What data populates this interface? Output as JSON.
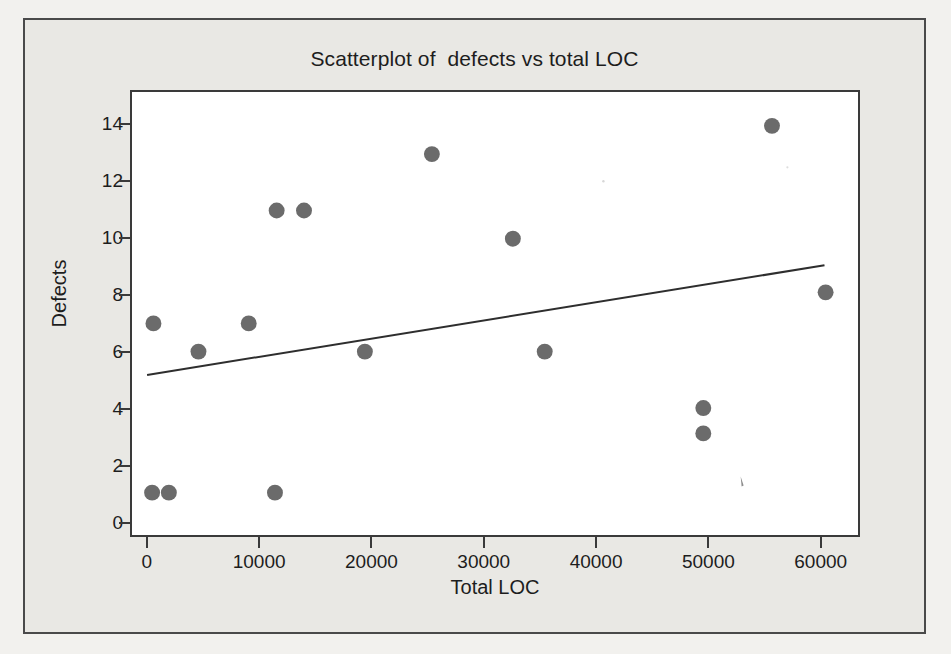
{
  "figure": {
    "title": "Scatterplot of  defects vs total LOC",
    "background_color": "#e9e8e4",
    "panel_color": "#ffffff",
    "frame_color": "#4a4a4a",
    "marker_color": "#6b6b6b",
    "line_color": "#2e2e2e"
  },
  "axes": {
    "x_title": "Total LOC",
    "y_title": "Defects",
    "x_ticks": [
      "0",
      "10000",
      "20000",
      "30000",
      "40000",
      "50000",
      "60000"
    ],
    "y_ticks": [
      "0",
      "2",
      "4",
      "6",
      "8",
      "10",
      "12",
      "14"
    ]
  },
  "chart_data": {
    "type": "scatter",
    "title": "Scatterplot of  defects vs total LOC",
    "xlabel": "Total LOC",
    "ylabel": "Defects",
    "xlim": [
      -1500,
      63500
    ],
    "ylim": [
      -0.5,
      15.2
    ],
    "xticks": [
      0,
      10000,
      20000,
      30000,
      40000,
      50000,
      60000
    ],
    "yticks": [
      0,
      2,
      4,
      6,
      8,
      10,
      12,
      14
    ],
    "grid": false,
    "legend": null,
    "points": [
      {
        "x": 300,
        "y": 1
      },
      {
        "x": 420,
        "y": 7
      },
      {
        "x": 1800,
        "y": 1
      },
      {
        "x": 4450,
        "y": 6
      },
      {
        "x": 8950,
        "y": 7
      },
      {
        "x": 11300,
        "y": 1
      },
      {
        "x": 11450,
        "y": 11
      },
      {
        "x": 13900,
        "y": 11
      },
      {
        "x": 19350,
        "y": 6
      },
      {
        "x": 25350,
        "y": 13
      },
      {
        "x": 32600,
        "y": 10
      },
      {
        "x": 35450,
        "y": 6
      },
      {
        "x": 49650,
        "y": 4
      },
      {
        "x": 49650,
        "y": 3.1
      },
      {
        "x": 55800,
        "y": 14
      },
      {
        "x": 60600,
        "y": 8.1
      }
    ],
    "fit_line": {
      "name": "linear regression fit",
      "x": [
        -150,
        60500
      ],
      "y": [
        5.17,
        9.06
      ]
    }
  }
}
